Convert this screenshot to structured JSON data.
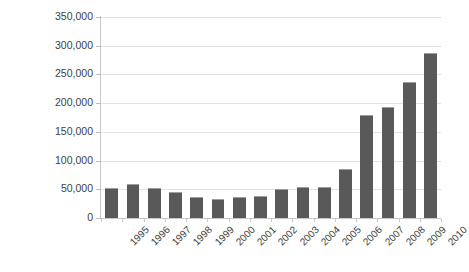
{
  "chart_data": {
    "type": "bar",
    "title": "",
    "subtitle": "",
    "xlabel": "",
    "ylabel": "",
    "categories": [
      "1995",
      "1996",
      "1997",
      "1998",
      "1999",
      "2000",
      "2001",
      "2002",
      "2003",
      "2004",
      "2005",
      "2006",
      "2007",
      "2008",
      "2009",
      "2010"
    ],
    "values": [
      52000,
      59000,
      52000,
      46000,
      37000,
      33000,
      36000,
      38000,
      51000,
      54000,
      54000,
      85000,
      180000,
      193000,
      236000,
      288000
    ],
    "series": [
      {
        "name": "Series 1",
        "values": [
          52000,
          59000,
          52000,
          46000,
          37000,
          33000,
          36000,
          38000,
          51000,
          54000,
          54000,
          85000,
          180000,
          193000,
          236000,
          288000
        ]
      }
    ],
    "ylim": [
      0,
      350000
    ],
    "ytick_values": [
      0,
      50000,
      100000,
      150000,
      200000,
      250000,
      300000,
      350000
    ],
    "ytick_labels": [
      "0",
      "50,000",
      "100,000",
      "150,000",
      "200,000",
      "250,000",
      "300,000",
      "350,000"
    ],
    "grid": true,
    "grid_axis": "y",
    "legend": false,
    "legend_position": "none",
    "bar_color": "#595959",
    "gridline_color": "#e2e2e2",
    "axis_color": "#c6c6c6",
    "background_color": "#ffffff",
    "xtick_label_rotation": -45
  }
}
